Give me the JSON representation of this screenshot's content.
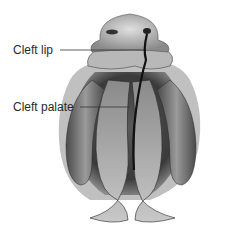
{
  "diagram": {
    "labels": [
      {
        "text": "Cleft lip",
        "target": "upper lip gap"
      },
      {
        "text": "Cleft palate",
        "target": "palate gap"
      }
    ]
  }
}
